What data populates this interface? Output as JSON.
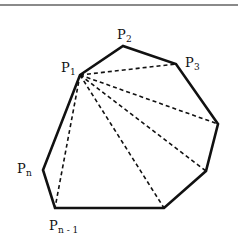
{
  "diagram": {
    "type": "polygon-triangulation",
    "top_rule_color": "#8a8a8a",
    "stroke_color": "#111111",
    "vertices": [
      {
        "id": "P1",
        "x": 80,
        "y": 75
      },
      {
        "id": "P2",
        "x": 123,
        "y": 46
      },
      {
        "id": "P3",
        "x": 176,
        "y": 64
      },
      {
        "id": "V4",
        "x": 218,
        "y": 124
      },
      {
        "id": "V5",
        "x": 206,
        "y": 171
      },
      {
        "id": "V6",
        "x": 164,
        "y": 208
      },
      {
        "id": "Pn-1",
        "x": 55,
        "y": 208
      },
      {
        "id": "Pn",
        "x": 43,
        "y": 170
      }
    ],
    "diagonals_from": "P1",
    "diagonals_to": [
      "P3",
      "V4",
      "V5",
      "V6",
      "Pn-1"
    ],
    "labels": {
      "p1": {
        "base": "P",
        "sub": "1"
      },
      "p2": {
        "base": "P",
        "sub": "2"
      },
      "p3": {
        "base": "P",
        "sub": "3"
      },
      "pn": {
        "base": "P",
        "sub": "n"
      },
      "pn1": {
        "base": "P",
        "sub": "n - 1"
      }
    }
  }
}
